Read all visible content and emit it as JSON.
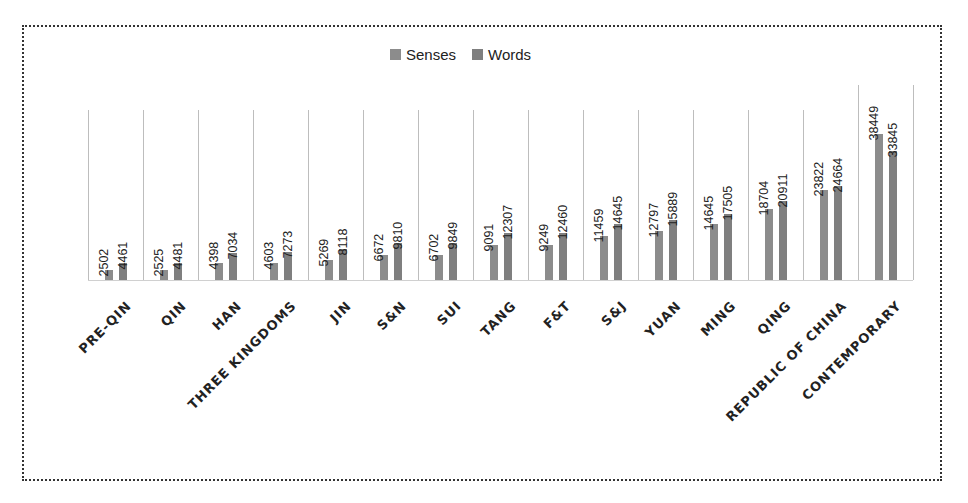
{
  "chart_data": {
    "type": "bar",
    "title": "",
    "xlabel": "",
    "ylabel": "",
    "grid": "vertical separators between categories",
    "legend_position": "top",
    "categories": [
      "PRE-QIN",
      "QIN",
      "HAN",
      "THREE KINGDOMS",
      "JIN",
      "S&N",
      "SUI",
      "TANG",
      "F&T",
      "S&J",
      "YUAN",
      "MING",
      "QING",
      "REPUBLIC OF CHINA",
      "CONTEMPORARY"
    ],
    "series": [
      {
        "name": "Senses",
        "color": "#8c8c8c",
        "values": [
          2502,
          2525,
          4398,
          4603,
          5269,
          6672,
          6702,
          9091,
          9249,
          11459,
          12797,
          14645,
          18704,
          23822,
          38449
        ]
      },
      {
        "name": "Words",
        "color": "#7f7f7f",
        "values": [
          4461,
          4481,
          7034,
          7273,
          8118,
          9810,
          9849,
          12307,
          12460,
          14645,
          15889,
          17505,
          20911,
          24664,
          33845
        ]
      }
    ],
    "ylim": [
      0,
      40000
    ]
  },
  "legend": {
    "items": [
      {
        "label": "Senses",
        "color": "#8c8c8c"
      },
      {
        "label": "Words",
        "color": "#7f7f7f"
      }
    ]
  }
}
